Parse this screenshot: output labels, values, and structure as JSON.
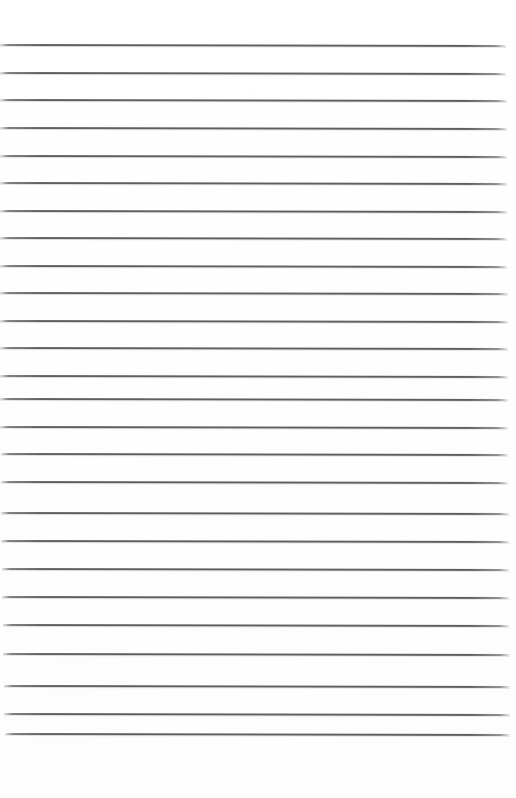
{
  "document": {
    "type": "lined-paper",
    "title": "Blank ruled paper sheet",
    "page_width": 516,
    "page_height": 798,
    "background_color": "#ffffff",
    "has_text": false,
    "text_content": ""
  },
  "ruling": {
    "line_color": "#5f5f5f",
    "line_count": 25,
    "line_thickness": 2,
    "first_line_y": 44,
    "line_spacing": 27.6,
    "last_line_y": 733,
    "left_inset": 0,
    "right_inset": 9,
    "tilt_degrees": 0.12,
    "lines": [
      {
        "index": 1,
        "y": 44,
        "x_start": 0,
        "x_end": 506
      },
      {
        "index": 2,
        "y": 72,
        "x_start": 0,
        "x_end": 506
      },
      {
        "index": 3,
        "y": 99,
        "x_start": 0,
        "x_end": 507
      },
      {
        "index": 4,
        "y": 127,
        "x_start": 0,
        "x_end": 507
      },
      {
        "index": 5,
        "y": 155,
        "x_start": 0,
        "x_end": 507
      },
      {
        "index": 6,
        "y": 182,
        "x_start": 0,
        "x_end": 507
      },
      {
        "index": 7,
        "y": 210,
        "x_start": 0,
        "x_end": 507
      },
      {
        "index": 8,
        "y": 237,
        "x_start": 0,
        "x_end": 507
      },
      {
        "index": 9,
        "y": 265,
        "x_start": 0,
        "x_end": 507
      },
      {
        "index": 10,
        "y": 292,
        "x_start": 0,
        "x_end": 508
      },
      {
        "index": 11,
        "y": 320,
        "x_start": 0,
        "x_end": 508
      },
      {
        "index": 12,
        "y": 347,
        "x_start": 0,
        "x_end": 508
      },
      {
        "index": 13,
        "y": 375,
        "x_start": 0,
        "x_end": 508
      },
      {
        "index": 14,
        "y": 398,
        "x_start": 0,
        "x_end": 508
      },
      {
        "index": 15,
        "y": 426,
        "x_start": 0,
        "x_end": 508
      },
      {
        "index": 16,
        "y": 453,
        "x_start": 1,
        "x_end": 508
      },
      {
        "index": 17,
        "y": 481,
        "x_start": 1,
        "x_end": 508
      },
      {
        "index": 18,
        "y": 512,
        "x_start": 1,
        "x_end": 509
      },
      {
        "index": 19,
        "y": 540,
        "x_start": 1,
        "x_end": 509
      },
      {
        "index": 20,
        "y": 568,
        "x_start": 2,
        "x_end": 509
      },
      {
        "index": 21,
        "y": 596,
        "x_start": 2,
        "x_end": 509
      },
      {
        "index": 22,
        "y": 624,
        "x_start": 3,
        "x_end": 509
      },
      {
        "index": 23,
        "y": 653,
        "x_start": 3,
        "x_end": 510
      },
      {
        "index": 24,
        "y": 685,
        "x_start": 4,
        "x_end": 510
      },
      {
        "index": 25,
        "y": 713,
        "x_start": 4,
        "x_end": 510
      },
      {
        "index": 26,
        "y": 733,
        "x_start": 5,
        "x_end": 510
      }
    ]
  },
  "margins": {
    "top_margin_height": 42,
    "bottom_margin_height": 62,
    "top_margin_label": "",
    "bottom_margin_label": ""
  }
}
